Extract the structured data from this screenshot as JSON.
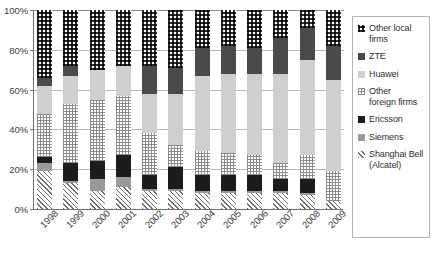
{
  "chart_data": {
    "type": "bar",
    "subtype": "stacked-100-percent",
    "title": "",
    "subtitle": "",
    "xlabel": "",
    "ylabel": "",
    "ylim": [
      0,
      100
    ],
    "yticks": [
      0,
      20,
      40,
      60,
      80,
      100
    ],
    "ytick_labels": [
      "0%",
      "20%",
      "40%",
      "60%",
      "80%",
      "100%"
    ],
    "grid": true,
    "grid_axis": "y",
    "legend_position": "right",
    "stack_order_bottom_to_top": [
      "Shanghai Bell (Alcatel)",
      "Siemens",
      "Ericsson",
      "Other foreign firms",
      "Huawei",
      "ZTE",
      "Other local firms"
    ],
    "categories": [
      "1998",
      "1999",
      "2000",
      "2001",
      "2002",
      "2003",
      "2004",
      "2005",
      "2006",
      "2007",
      "2008",
      "2009"
    ],
    "series": [
      {
        "name": "Shanghai Bell (Alcatel)",
        "pattern": "diagonal-hatch",
        "color": "#6d6d6d",
        "values": [
          19,
          13,
          9,
          11,
          9,
          9,
          8,
          8,
          8,
          8,
          7,
          4
        ]
      },
      {
        "name": "Siemens",
        "pattern": "solid-grey",
        "color": "#9a9a9a",
        "values": [
          4,
          1,
          6,
          5,
          1,
          1,
          1,
          1,
          1,
          1,
          1,
          0
        ]
      },
      {
        "name": "Ericsson",
        "pattern": "solid-black",
        "color": "#1c1c1c",
        "values": [
          3,
          9,
          9,
          11,
          7,
          11,
          8,
          8,
          8,
          6,
          7,
          0
        ]
      },
      {
        "name": "Other foreign firms",
        "pattern": "light-checker",
        "color": "#8a8a8a",
        "values": [
          22,
          30,
          31,
          30,
          21,
          11,
          12,
          11,
          10,
          8,
          12,
          15
        ]
      },
      {
        "name": "Huawei",
        "pattern": "light-grey",
        "color": "#cfcfcf",
        "values": [
          14,
          14,
          15,
          15,
          20,
          26,
          38,
          40,
          41,
          45,
          48,
          46
        ]
      },
      {
        "name": "ZTE",
        "pattern": "dark-grey",
        "color": "#4a4a4a",
        "values": [
          4,
          5,
          0,
          0,
          14,
          13,
          14,
          14,
          13,
          18,
          16,
          17
        ]
      },
      {
        "name": "Other local firms",
        "pattern": "bold-checker",
        "color": "#2b2b2b",
        "values": [
          34,
          28,
          30,
          28,
          28,
          29,
          19,
          18,
          19,
          14,
          9,
          18
        ]
      }
    ]
  },
  "axis": {
    "y_tick_labels": [
      "100%",
      "80%",
      "60%",
      "40%",
      "20%",
      "0%"
    ],
    "x_tick_labels": [
      "1998",
      "1999",
      "2000",
      "2001",
      "2002",
      "2003",
      "2004",
      "2005",
      "2006",
      "2007",
      "2008",
      "2009"
    ]
  },
  "legend": {
    "items": [
      {
        "label": "Other local\nfirms",
        "key": "Other local firms",
        "swatch": "bold-checker"
      },
      {
        "label": "ZTE",
        "key": "ZTE",
        "swatch": "dark-grey"
      },
      {
        "label": "Huawei",
        "key": "Huawei",
        "swatch": "light-grey"
      },
      {
        "label": "Other\nforeign firms",
        "key": "Other foreign firms",
        "swatch": "light-checker"
      },
      {
        "label": "Ericsson",
        "key": "Ericsson",
        "swatch": "solid-black"
      },
      {
        "label": "Siemens",
        "key": "Siemens",
        "swatch": "solid-grey"
      },
      {
        "label": "Shanghai Bell\n(Alcatel)",
        "key": "Shanghai Bell (Alcatel)",
        "swatch": "diagonal-hatch"
      }
    ]
  },
  "colors": {
    "shanghai_bell": "#6d6d6d",
    "siemens": "#9a9a9a",
    "ericsson": "#1c1c1c",
    "other_foreign": "#8a8a8a",
    "huawei": "#cfcfcf",
    "zte": "#4a4a4a",
    "other_local": "#2b2b2b",
    "gridline": "#b9b9b9",
    "axis": "#6f6f6f",
    "text": "#3b3b3b"
  }
}
